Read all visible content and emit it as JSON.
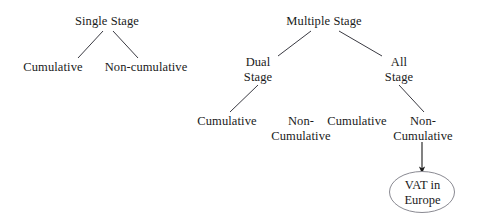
{
  "diagram": {
    "stroke_color": "#3a3a42",
    "text_color": "#1a1a1a",
    "background_color": "#ffffff",
    "nodes": {
      "single_stage": "Single Stage",
      "single_cumulative": "Cumulative",
      "single_non_cumulative": "Non-cumulative",
      "multiple_stage": "Multiple Stage",
      "dual_stage_line1": "Dual",
      "dual_stage_line2": "Stage",
      "all_stage_line1": "All",
      "all_stage_line2": "Stage",
      "dual_cumulative": "Cumulative",
      "dual_non_cumulative_line1": "Non-",
      "dual_non_cumulative_line2": "Cumulative",
      "all_cumulative": "Cumulative",
      "all_non_cumulative_line1": "Non-",
      "all_non_cumulative_line2": "Cumulative",
      "vat_oval_line1": "VAT in",
      "vat_oval_line2": "Europe"
    }
  }
}
